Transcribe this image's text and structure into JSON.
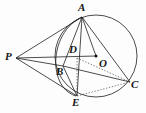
{
  "figure": {
    "kind": "geometry-diagram",
    "background_color": "#fdfdfd",
    "stroke_color": "#1a1a1a",
    "label_color": "#161616",
    "canvas": {
      "width": 146,
      "height": 113
    },
    "circle": {
      "name": "main-circle",
      "cx": 96,
      "cy": 56,
      "r": 41,
      "stroke": "#2a2a2a"
    },
    "arc_through_A_B_E": {
      "name": "inner-arc",
      "path": "M 82 17 C 62 26 54 50 56 68 C 58 84 66 93 76 96",
      "stroke": "#2a2a2a"
    },
    "points": [
      {
        "id": "A",
        "label": "A",
        "x": 82,
        "y": 17,
        "label_x": 78,
        "label_y": 2,
        "dot": false
      },
      {
        "id": "P",
        "label": "P",
        "x": 16,
        "y": 58,
        "label_x": 5,
        "label_y": 51,
        "dot": false
      },
      {
        "id": "D",
        "label": "D",
        "x": 77,
        "y": 58,
        "label_x": 69,
        "label_y": 44,
        "dot": false
      },
      {
        "id": "O",
        "label": "O",
        "x": 96,
        "y": 56,
        "label_x": 99,
        "label_y": 58,
        "dot": true
      },
      {
        "id": "B",
        "label": "B",
        "x": 63,
        "y": 66,
        "label_x": 56,
        "label_y": 66,
        "dot": false
      },
      {
        "id": "C",
        "label": "C",
        "x": 130,
        "y": 82,
        "label_x": 131,
        "label_y": 79,
        "dot": false
      },
      {
        "id": "E",
        "label": "E",
        "x": 77,
        "y": 96,
        "label_x": 72,
        "label_y": 97,
        "dot": false
      }
    ],
    "segments": [
      {
        "name": "segment-P-A",
        "from": "P",
        "to": "A",
        "style": "solid"
      },
      {
        "name": "segment-P-D",
        "from": "P",
        "to": "D",
        "style": "solid"
      },
      {
        "name": "segment-P-O",
        "from": "P",
        "to": "O",
        "style": "solid"
      },
      {
        "name": "segment-P-B",
        "from": "P",
        "to": "B",
        "style": "solid"
      },
      {
        "name": "segment-P-E",
        "from": "P",
        "to": "E",
        "style": "solid"
      },
      {
        "name": "segment-A-B",
        "from": "A",
        "to": "B",
        "style": "solid"
      },
      {
        "name": "segment-A-E",
        "from": "A",
        "to": "E",
        "style": "solid"
      },
      {
        "name": "segment-A-C",
        "from": "A",
        "to": "C",
        "style": "solid"
      },
      {
        "name": "segment-A-O",
        "from": "A",
        "to": "O",
        "style": "solid"
      },
      {
        "name": "segment-B-C",
        "from": "B",
        "to": "C",
        "style": "solid"
      },
      {
        "name": "segment-B-E",
        "from": "B",
        "to": "E",
        "style": "solid"
      },
      {
        "name": "segment-D-C",
        "from": "D",
        "to": "C",
        "style": "dotted"
      },
      {
        "name": "segment-E-C",
        "from": "E",
        "to": "C",
        "style": "dotted"
      },
      {
        "name": "segment-D-E",
        "from": "D",
        "to": "E",
        "style": "dotted"
      }
    ]
  }
}
